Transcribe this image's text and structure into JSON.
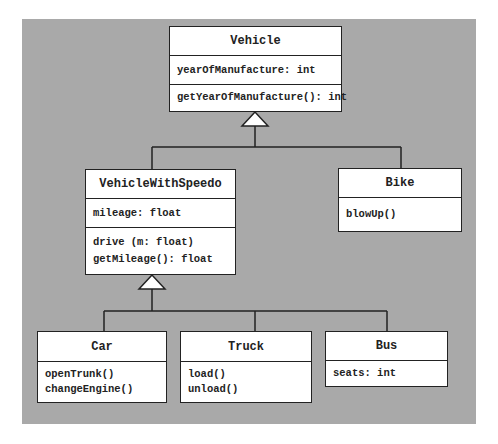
{
  "diagram": {
    "type": "UML class diagram",
    "colors": {
      "background": "#a9a9a9",
      "box_fill": "#ffffff",
      "stroke": "#222222"
    },
    "classes": {
      "vehicle": {
        "name": "Vehicle",
        "attributes": [
          "yearOfManufacture: int"
        ],
        "methods": [
          "getYearOfManufacture(): int"
        ]
      },
      "vehicle_with_speedo": {
        "name": "VehicleWithSpeedo",
        "attributes": [
          "mileage: float"
        ],
        "methods": [
          "drive (m: float)",
          "getMileage(): float"
        ]
      },
      "bike": {
        "name": "Bike",
        "methods": [
          "blowUp()"
        ]
      },
      "car": {
        "name": "Car",
        "methods": [
          "openTrunk()",
          "changeEngine()"
        ]
      },
      "truck": {
        "name": "Truck",
        "methods": [
          "load()",
          "unload()"
        ]
      },
      "bus": {
        "name": "Bus",
        "attributes": [
          "seats: int"
        ]
      }
    },
    "relationships": [
      {
        "type": "generalization",
        "parent": "Vehicle",
        "children": [
          "VehicleWithSpeedo",
          "Bike"
        ]
      },
      {
        "type": "generalization",
        "parent": "VehicleWithSpeedo",
        "children": [
          "Car",
          "Truck",
          "Bus"
        ]
      }
    ]
  }
}
